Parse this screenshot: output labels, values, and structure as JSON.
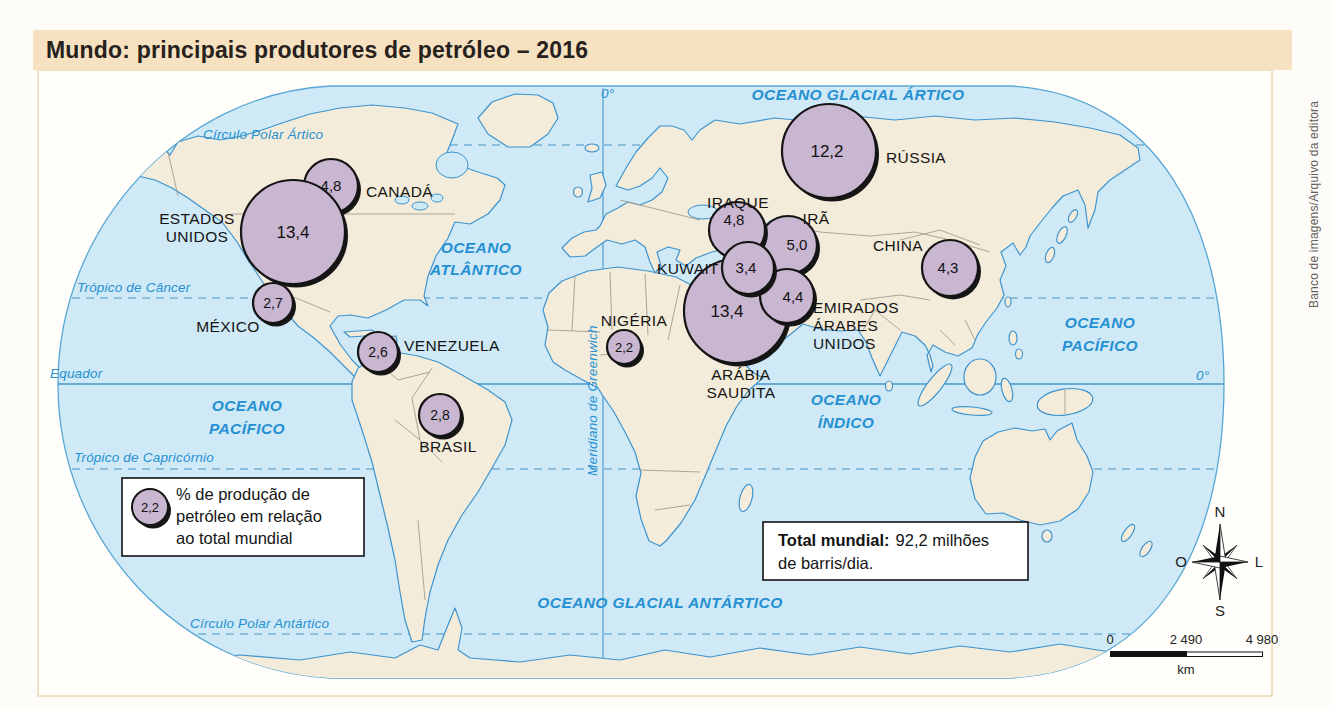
{
  "title": "Mundo: principais produtores de petróleo – 2016",
  "credit": "Banco de imagens/Arquivo da editora",
  "legend": {
    "sample_value": "2,2",
    "lines": [
      "% de produção de",
      "petróleo em relação",
      "ao total mundial"
    ]
  },
  "total_box": {
    "label": "Total mundial:",
    "value_text": "92,2 milhões",
    "line2": "de barris/dia."
  },
  "compass": {
    "north": "N",
    "south": "S",
    "west": "O",
    "east": "L"
  },
  "scale_bar": {
    "ticks": [
      "0",
      "2 490",
      "4 980"
    ],
    "unit": "km"
  },
  "graticule": {
    "arctic_circle": "Círculo Polar Ártico",
    "tropic_cancer": "Trópico de Câncer",
    "equator": "Equador",
    "tropic_capricorn": "Trópico de Capricórnio",
    "antarctic_circle": "Círculo Polar Antártico",
    "greenwich": "Meridiano de Greenwich",
    "prime_meridian_top": "0°",
    "equator_right": "0°"
  },
  "oceans": {
    "arctic": "OCEANO GLACIAL ÁRTICO",
    "atlantic": [
      "OCEANO",
      "ATLÂNTICO"
    ],
    "pacific_west": [
      "OCEANO",
      "PACÍFICO"
    ],
    "pacific_east": [
      "OCEANO",
      "PACÍFICO"
    ],
    "indian": [
      "OCEANO",
      "ÍNDICO"
    ],
    "antarctic": "OCEANO GLACIAL ANTÁRTICO"
  },
  "producers": [
    {
      "id": "estados-unidos",
      "country_lines": [
        "ESTADOS",
        "UNIDOS"
      ],
      "value": "13,4"
    },
    {
      "id": "canada",
      "country_lines": [
        "CANADÁ"
      ],
      "value": "4,8"
    },
    {
      "id": "mexico",
      "country_lines": [
        "MÉXICO"
      ],
      "value": "2,7"
    },
    {
      "id": "venezuela",
      "country_lines": [
        "VENEZUELA"
      ],
      "value": "2,6"
    },
    {
      "id": "brasil",
      "country_lines": [
        "BRASIL"
      ],
      "value": "2,8"
    },
    {
      "id": "nigeria",
      "country_lines": [
        "NIGÉRIA"
      ],
      "value": "2,2"
    },
    {
      "id": "russia",
      "country_lines": [
        "RÚSSIA"
      ],
      "value": "12,2"
    },
    {
      "id": "iraque",
      "country_lines": [
        "IRAQUE"
      ],
      "value": "4,8"
    },
    {
      "id": "ira",
      "country_lines": [
        "IRÃ"
      ],
      "value": "5,0"
    },
    {
      "id": "kuwait",
      "country_lines": [
        "KUWAIT"
      ],
      "value": "3,4"
    },
    {
      "id": "arabia-saudita",
      "country_lines": [
        "ARÁBIA",
        "SAUDITA"
      ],
      "value": "13,4"
    },
    {
      "id": "emirados",
      "country_lines": [
        "EMIRADOS",
        "ÁRABES",
        "UNIDOS"
      ],
      "value": "4,4"
    },
    {
      "id": "china",
      "country_lines": [
        "CHINA"
      ],
      "value": "4,3"
    }
  ],
  "colors": {
    "title_bar_bg": "#f6e2c0",
    "panel_border": "#e9d7b2",
    "ocean": "#cfe9f6",
    "land": "#f4ecda",
    "coastline": "#3d94cf",
    "circle_fill": "#c9b6d1",
    "circle_stroke": "#141414",
    "ocean_label_blue": "#2590d2",
    "country_border_gray": "#a39d90"
  }
}
